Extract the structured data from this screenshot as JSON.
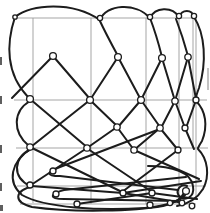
{
  "figure": {
    "canvas": {
      "width": 210,
      "height": 213,
      "background": "#ffffff"
    },
    "colors": {
      "ink": "#1c1c1c",
      "grid": "#9b9b9b",
      "artifact": "#5f5f5f",
      "smudge": "#c2c2c2",
      "loop_fill": "#ffffff"
    },
    "stroke_widths": {
      "thread": 2.0,
      "grid": 0.9,
      "loop": 1.3
    },
    "grid": {
      "vertical_lines": [
        {
          "x": 33,
          "y1": 18,
          "y2": 203
        },
        {
          "x": 91,
          "y1": 18,
          "y2": 204
        },
        {
          "x": 146,
          "y1": 18,
          "y2": 204
        },
        {
          "x": 179,
          "y1": 17,
          "y2": 204
        },
        {
          "x": 193,
          "y1": 17,
          "y2": 148
        },
        {
          "x": 196,
          "y1": 17,
          "y2": 200
        }
      ],
      "horizontal_lines": [
        {
          "y": 18,
          "x1": 15,
          "x2": 196
        },
        {
          "y": 100,
          "x1": 14,
          "x2": 207
        },
        {
          "y": 148,
          "x1": 16,
          "x2": 208
        },
        {
          "y": 186,
          "x1": 17,
          "x2": 206
        },
        {
          "y": 204,
          "x1": 20,
          "x2": 196
        }
      ]
    },
    "threads": [
      {
        "d": "M15,17 C32,4 72,1 100,20"
      },
      {
        "d": "M100,20 C106,4 136,2 150,18"
      },
      {
        "d": "M150,18 C155,7 172,6 179,17"
      },
      {
        "d": "M179,17 C182,9 192,9 194,17"
      },
      {
        "d": "M15,17 C6,44 6,74 28,97"
      },
      {
        "d": "M30,101 C13,111 12,132 29,146"
      },
      {
        "d": "M31,149 C13,158 12,177 30,186"
      },
      {
        "d": "M194,17 C205,34 207,62 199,88 C197,93 196,96 196,99"
      },
      {
        "d": "M196,101 C206,111 208,126 202,141 C200,144 199,146 198,148"
      },
      {
        "d": "M198,149 C208,159 210,176 203,189 C197,199 188,204 177,206"
      },
      {
        "d": "M32,148 C10,162 7,182 22,195 C45,208 100,211 145,208 C168,206 183,200 187,192"
      },
      {
        "d": "M33,186 C14,191 13,202 32,207 C75,213 135,211 163,206 C176,203 183,197 184,192"
      },
      {
        "d": "M148,166 C172,166 191,172 193,186 C195,198 184,202 179,196 C175,190 181,183 187,186"
      },
      {
        "d": "M99,19 C105,32 112,45 118,56"
      },
      {
        "d": "M150,18 C155,31 159,45 162,57"
      },
      {
        "d": "M176,19 C181,32 185,45 188,56"
      },
      {
        "d": "M53,56 L12,98"
      },
      {
        "d": "M53,56 L90,99"
      },
      {
        "d": "M118,57 L90,100"
      },
      {
        "d": "M118,57 L141,100"
      },
      {
        "d": "M162,58 L141,100"
      },
      {
        "d": "M162,58 L175,101"
      },
      {
        "d": "M188,57 L175,101"
      },
      {
        "d": "M188,57 L196,99"
      },
      {
        "d": "M30,99 L88,148"
      },
      {
        "d": "M90,100 L32,146"
      },
      {
        "d": "M90,100 L117,126"
      },
      {
        "d": "M141,100 L118,127"
      },
      {
        "d": "M141,100 L160,127"
      },
      {
        "d": "M175,101 L161,128"
      },
      {
        "d": "M175,101 L185,128"
      },
      {
        "d": "M196,100 L186,128"
      },
      {
        "d": "M117,127 L87,148"
      },
      {
        "d": "M117,127 L134,150"
      },
      {
        "d": "M160,128 L134,150"
      },
      {
        "d": "M160,128 L178,150"
      },
      {
        "d": "M185,128 L194,149"
      },
      {
        "d": "M30,147 L122,192"
      },
      {
        "d": "M87,148 L31,185"
      },
      {
        "d": "M88,149 L152,192"
      },
      {
        "d": "M178,150 L122,192"
      },
      {
        "d": "M134,150 L199,179"
      },
      {
        "d": "M160,129 L60,167 C46,172 46,176 60,176 L178,190"
      },
      {
        "d": "M186,177 L64,190 C49,194 49,199 64,199 L178,201"
      },
      {
        "d": "M31,186 L123,193 L184,203"
      },
      {
        "d": "M123,193 L201,181"
      },
      {
        "d": "M152,193 L77,204"
      },
      {
        "d": "M152,193 L197,199"
      }
    ],
    "loops": [
      {
        "cx": 15,
        "cy": 17,
        "r": 2.2
      },
      {
        "cx": 100,
        "cy": 18,
        "r": 2.6
      },
      {
        "cx": 150,
        "cy": 17,
        "r": 2.6
      },
      {
        "cx": 179,
        "cy": 16,
        "r": 2.6
      },
      {
        "cx": 194,
        "cy": 16,
        "r": 2.6
      },
      {
        "cx": 53,
        "cy": 56,
        "r": 3.4
      },
      {
        "cx": 118,
        "cy": 57,
        "r": 3.4
      },
      {
        "cx": 162,
        "cy": 58,
        "r": 3.4
      },
      {
        "cx": 188,
        "cy": 57,
        "r": 3.2
      },
      {
        "cx": 30,
        "cy": 99,
        "r": 3.4
      },
      {
        "cx": 90,
        "cy": 100,
        "r": 3.4
      },
      {
        "cx": 141,
        "cy": 100,
        "r": 3.4
      },
      {
        "cx": 175,
        "cy": 101,
        "r": 3.2
      },
      {
        "cx": 196,
        "cy": 100,
        "r": 3.0
      },
      {
        "cx": 117,
        "cy": 127,
        "r": 3.2
      },
      {
        "cx": 160,
        "cy": 128,
        "r": 3.2
      },
      {
        "cx": 185,
        "cy": 128,
        "r": 3.0
      },
      {
        "cx": 30,
        "cy": 147,
        "r": 3.2
      },
      {
        "cx": 87,
        "cy": 148,
        "r": 3.2
      },
      {
        "cx": 134,
        "cy": 150,
        "r": 3.2
      },
      {
        "cx": 178,
        "cy": 150,
        "r": 3.0
      },
      {
        "cx": 53,
        "cy": 171,
        "r": 3.0
      },
      {
        "cx": 56,
        "cy": 194,
        "r": 3.0
      },
      {
        "cx": 30,
        "cy": 185,
        "r": 3.0
      },
      {
        "cx": 123,
        "cy": 193,
        "r": 3.0
      },
      {
        "cx": 152,
        "cy": 193,
        "r": 3.0
      },
      {
        "cx": 77,
        "cy": 204,
        "r": 3.0
      },
      {
        "cx": 150,
        "cy": 205,
        "r": 3.0
      },
      {
        "cx": 182,
        "cy": 203,
        "r": 2.8
      },
      {
        "cx": 170,
        "cy": 203,
        "r": 2.6
      },
      {
        "cx": 192,
        "cy": 206,
        "r": 2.8
      },
      {
        "cx": 186,
        "cy": 191,
        "r": 3.4
      }
    ],
    "edge_marks": [
      {
        "x": 0,
        "y": 57,
        "w": 2,
        "h": 8
      },
      {
        "x": 0,
        "y": 96,
        "w": 2,
        "h": 8
      },
      {
        "x": 0,
        "y": 145,
        "w": 2,
        "h": 8
      },
      {
        "x": 0,
        "y": 183,
        "w": 2,
        "h": 8
      },
      {
        "x": 0,
        "y": 205,
        "w": 3,
        "h": 6
      }
    ],
    "smudges": [
      {
        "x": 207,
        "y": 68,
        "w": 2,
        "h": 22
      }
    ]
  }
}
